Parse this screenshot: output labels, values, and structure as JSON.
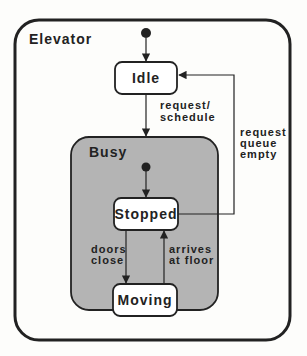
{
  "diagram": {
    "type": "state-machine",
    "outer_state": {
      "name": "Elevator"
    },
    "composite_state": {
      "name": "Busy",
      "fill": "#b4b4b4"
    },
    "states": [
      {
        "id": "idle",
        "name": "Idle"
      },
      {
        "id": "stopped",
        "name": "Stopped"
      },
      {
        "id": "moving",
        "name": "Moving"
      }
    ],
    "transitions": [
      {
        "from": "initial-outer",
        "to": "idle",
        "label": []
      },
      {
        "from": "idle",
        "to": "busy",
        "label": [
          "request/",
          "schedule"
        ]
      },
      {
        "from": "stopped",
        "to": "idle",
        "label": [
          "request",
          "queue",
          "empty"
        ]
      },
      {
        "from": "initial-busy",
        "to": "stopped",
        "label": []
      },
      {
        "from": "stopped",
        "to": "moving",
        "label": [
          "doors",
          "close"
        ]
      },
      {
        "from": "moving",
        "to": "stopped",
        "label": [
          "arrives",
          "at floor"
        ]
      }
    ],
    "colors": {
      "stroke": "#222222",
      "background": "#fdfdfb",
      "state_fill": "#ffffff"
    }
  }
}
